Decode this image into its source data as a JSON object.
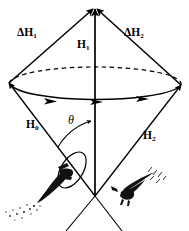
{
  "figure": {
    "background_color": "#ffffff",
    "stroke_color": "#000000",
    "width": 189,
    "height": 231
  },
  "labels": {
    "delta_h1": "ΔH",
    "delta_h1_sub": "1",
    "delta_h2": "ΔH",
    "delta_h2_sub": "2",
    "h1": "H",
    "h1_sub": "1",
    "h0": "H",
    "h0_sub": "0",
    "h2": "H",
    "h2_sub": "2",
    "theta": "θ"
  },
  "elements": {
    "apex_vector_label": "H1-vertical-vector",
    "left_diagonal_label": "delta-H1-vector",
    "right_diagonal_label": "delta-H2-vector",
    "lower_left_line_label": "H0-vector",
    "lower_right_line_label": "H2-vector",
    "cone_ellipse_label": "precession-ellipse",
    "small_ellipse_label": "small-precession-ellipse",
    "angle_arc_label": "theta-angle-arc",
    "bird_left_label": "bird-figure-left",
    "bird_right_label": "bird-figure-right"
  }
}
